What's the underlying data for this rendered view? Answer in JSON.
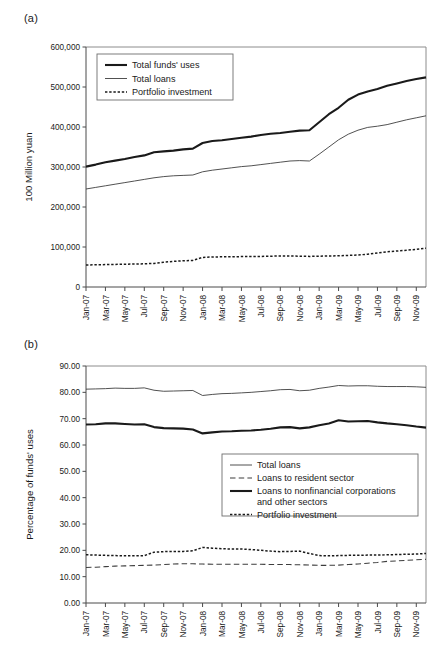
{
  "figure": {
    "panel_a_tag": "(a)",
    "panel_b_tag": "(b)"
  },
  "chart_data": [
    {
      "id": "panel-a",
      "type": "line",
      "title": "",
      "panel_label": "(a)",
      "xlabel": "",
      "ylabel": "100 Million yuan",
      "ylim": [
        0,
        600000
      ],
      "yticks": [
        0,
        100000,
        200000,
        300000,
        400000,
        500000,
        600000
      ],
      "ytick_labels": [
        "0",
        "100,000",
        "200,000",
        "300,000",
        "400,000",
        "500,000",
        "600,000"
      ],
      "grid": false,
      "legend_position": "top-left",
      "categories": [
        "Jan-07",
        "Mar-07",
        "May-07",
        "Jul-07",
        "Sep-07",
        "Nov-07",
        "Jan-08",
        "Mar-08",
        "May-08",
        "Jul-08",
        "Sep-08",
        "Nov-08",
        "Jan-09",
        "Mar-09",
        "May-09",
        "Jul-09",
        "Sep-09",
        "Nov-09"
      ],
      "x": [
        "Jan-07",
        "Feb-07",
        "Mar-07",
        "Apr-07",
        "May-07",
        "Jun-07",
        "Jul-07",
        "Aug-07",
        "Sep-07",
        "Oct-07",
        "Nov-07",
        "Dec-07",
        "Jan-08",
        "Feb-08",
        "Mar-08",
        "Apr-08",
        "May-08",
        "Jun-08",
        "Jul-08",
        "Aug-08",
        "Sep-08",
        "Oct-08",
        "Nov-08",
        "Dec-08",
        "Jan-09",
        "Feb-09",
        "Mar-09",
        "Apr-09",
        "May-09",
        "Jun-09",
        "Jul-09",
        "Aug-09",
        "Sep-09",
        "Oct-09",
        "Nov-09",
        "Dec-09"
      ],
      "series": [
        {
          "name": "Total funds' uses",
          "style": "thick-solid",
          "values": [
            301000,
            306000,
            312000,
            316000,
            320000,
            325000,
            329000,
            337000,
            339000,
            341000,
            344000,
            346000,
            360000,
            365000,
            367000,
            370000,
            373000,
            376000,
            380000,
            383000,
            385000,
            388000,
            391000,
            392000,
            412000,
            432000,
            448000,
            468000,
            481000,
            489000,
            495000,
            503000,
            509000,
            515000,
            520000,
            524000
          ]
        },
        {
          "name": "Total loans",
          "style": "thin-solid",
          "values": [
            245000,
            249000,
            253000,
            257000,
            261000,
            265000,
            269000,
            273000,
            276000,
            278000,
            279000,
            280000,
            288000,
            292000,
            295000,
            298000,
            301000,
            303000,
            306000,
            309000,
            312000,
            315000,
            316000,
            315000,
            332000,
            350000,
            368000,
            382000,
            392000,
            399000,
            402000,
            406000,
            412000,
            418000,
            423000,
            428000
          ]
        },
        {
          "name": "Portfolio investment",
          "style": "dotted",
          "values": [
            55000,
            55500,
            56000,
            56500,
            57000,
            57500,
            58000,
            59000,
            62000,
            64000,
            65500,
            66500,
            74000,
            75000,
            75500,
            75500,
            76000,
            76000,
            76500,
            77000,
            77500,
            77500,
            77000,
            76500,
            77000,
            77500,
            78000,
            79000,
            80000,
            82000,
            85000,
            88000,
            90000,
            92000,
            94000,
            97000
          ]
        }
      ]
    },
    {
      "id": "panel-b",
      "type": "line",
      "title": "",
      "panel_label": "(b)",
      "xlabel": "",
      "ylabel": "Percentage of funds' uses",
      "ylim": [
        0,
        90
      ],
      "yticks": [
        0,
        10,
        20,
        30,
        40,
        50,
        60,
        70,
        80,
        90
      ],
      "ytick_labels": [
        "0.00",
        "10.00",
        "20.00",
        "30.00",
        "40.00",
        "50.00",
        "60.00",
        "70.00",
        "80.00",
        "90.00"
      ],
      "grid": false,
      "legend_position": "middle-right",
      "categories": [
        "Jan-07",
        "Mar-07",
        "May-07",
        "Jul-07",
        "Sep-07",
        "Nov-07",
        "Jan-08",
        "Mar-08",
        "May-08",
        "Jul-08",
        "Sep-08",
        "Nov-08",
        "Jan-09",
        "Mar-09",
        "May-09",
        "Jul-09",
        "Sep-09",
        "Nov-09"
      ],
      "x": [
        "Jan-07",
        "Feb-07",
        "Mar-07",
        "Apr-07",
        "May-07",
        "Jun-07",
        "Jul-07",
        "Aug-07",
        "Sep-07",
        "Oct-07",
        "Nov-07",
        "Dec-07",
        "Jan-08",
        "Feb-08",
        "Mar-08",
        "Apr-08",
        "May-08",
        "Jun-08",
        "Jul-08",
        "Aug-08",
        "Sep-08",
        "Oct-08",
        "Nov-08",
        "Dec-08",
        "Jan-09",
        "Feb-09",
        "Mar-09",
        "Apr-09",
        "May-09",
        "Jun-09",
        "Jul-09",
        "Aug-09",
        "Sep-09",
        "Oct-09",
        "Nov-09",
        "Dec-09"
      ],
      "series": [
        {
          "name": "Total loans",
          "style": "thin-solid",
          "values": [
            81.2,
            81.3,
            81.4,
            81.6,
            81.5,
            81.5,
            81.7,
            80.8,
            80.4,
            80.5,
            80.6,
            80.7,
            78.8,
            79.2,
            79.5,
            79.6,
            79.8,
            80.0,
            80.3,
            80.6,
            81.0,
            81.1,
            80.6,
            80.8,
            81.5,
            82.0,
            82.6,
            82.4,
            82.5,
            82.5,
            82.3,
            82.2,
            82.2,
            82.2,
            82.1,
            81.9
          ]
        },
        {
          "name": "Loans to resident sector",
          "style": "dashed",
          "values": [
            13.5,
            13.6,
            13.8,
            14.0,
            14.1,
            14.2,
            14.3,
            14.4,
            14.6,
            14.8,
            14.9,
            14.9,
            14.8,
            14.7,
            14.7,
            14.7,
            14.7,
            14.7,
            14.7,
            14.6,
            14.6,
            14.6,
            14.5,
            14.4,
            14.3,
            14.3,
            14.4,
            14.6,
            14.8,
            15.1,
            15.4,
            15.8,
            16.0,
            16.2,
            16.4,
            16.6
          ]
        },
        {
          "name": "Loans to nonfinancial corporations and other sectors",
          "style": "thick-solid",
          "values": [
            67.8,
            67.9,
            68.2,
            68.2,
            68.0,
            67.8,
            67.9,
            66.8,
            66.4,
            66.3,
            66.2,
            65.9,
            64.4,
            64.8,
            65.1,
            65.2,
            65.4,
            65.5,
            65.8,
            66.2,
            66.7,
            66.8,
            66.3,
            66.7,
            67.5,
            68.2,
            69.4,
            68.9,
            69.0,
            69.1,
            68.6,
            68.2,
            67.9,
            67.5,
            67.0,
            66.6
          ]
        },
        {
          "name": "Portfolio investment",
          "style": "dotted",
          "values": [
            18.3,
            18.2,
            18.1,
            18.0,
            17.9,
            17.9,
            18.0,
            19.3,
            19.5,
            19.6,
            19.6,
            19.8,
            21.1,
            20.8,
            20.6,
            20.5,
            20.5,
            20.3,
            20.0,
            19.7,
            19.5,
            19.6,
            19.7,
            18.8,
            18.0,
            17.9,
            18.0,
            18.1,
            18.1,
            18.2,
            18.2,
            18.3,
            18.4,
            18.5,
            18.6,
            18.8
          ]
        }
      ]
    }
  ]
}
